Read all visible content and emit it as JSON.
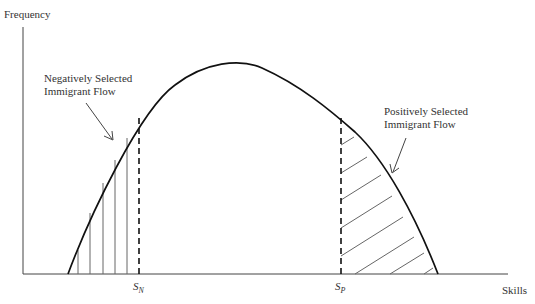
{
  "diagram": {
    "y_axis_label": "Frequency",
    "x_axis_label": "Skills",
    "annotations": {
      "negative": {
        "line1": "Negatively Selected",
        "line2": "Immigrant Flow"
      },
      "positive": {
        "line1": "Positively Selected",
        "line2": "Immigrant Flow"
      }
    },
    "thresholds": {
      "sn": {
        "base": "S",
        "sub": "N"
      },
      "sp": {
        "base": "S",
        "sub": "P"
      }
    },
    "colors": {
      "curve": "#111111",
      "axis": "#333333",
      "hatch": "#555555"
    }
  }
}
